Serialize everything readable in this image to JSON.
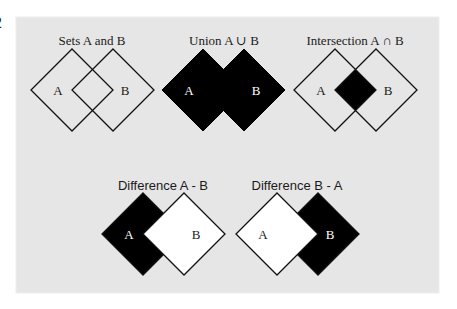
{
  "edge_fragment": {
    "text": "2"
  },
  "colors": {
    "panel": "#e6e6e6",
    "fill": "#000000",
    "outline": "#111111",
    "white": "#ffffff",
    "label_dark": "#1a1a1a",
    "label_light": "#ffffff"
  },
  "panel": {
    "x": 16,
    "y": 17,
    "w": 423,
    "h": 276
  },
  "diagram_size": 41,
  "diagrams": [
    {
      "id": "sets",
      "title": "Sets A and B",
      "title_font": "serif",
      "title_x": 92,
      "title_y": 45,
      "a": {
        "cx": 72,
        "cy": 90,
        "label": "A"
      },
      "b": {
        "cx": 113,
        "cy": 90,
        "label": "B"
      },
      "mode": "outline"
    },
    {
      "id": "union",
      "title": "Union A ∪ B",
      "title_font": "serif",
      "title_x": 224,
      "title_y": 45,
      "a": {
        "cx": 203,
        "cy": 90,
        "label": "A"
      },
      "b": {
        "cx": 244,
        "cy": 90,
        "label": "B"
      },
      "mode": "union"
    },
    {
      "id": "intersection",
      "title": "Intersection A ∩ B",
      "title_font": "serif",
      "title_x": 355,
      "title_y": 45,
      "a": {
        "cx": 335,
        "cy": 90,
        "label": "A"
      },
      "b": {
        "cx": 376,
        "cy": 90,
        "label": "B"
      },
      "mode": "intersection"
    },
    {
      "id": "diff-a-b",
      "title": "Difference A - B",
      "title_font": "sans",
      "title_x": 163,
      "title_y": 190,
      "a": {
        "cx": 143,
        "cy": 234,
        "label": "A"
      },
      "b": {
        "cx": 184,
        "cy": 234,
        "label": "B"
      },
      "mode": "a_minus_b"
    },
    {
      "id": "diff-b-a",
      "title": "Difference B - A",
      "title_font": "sans",
      "title_x": 297,
      "title_y": 190,
      "a": {
        "cx": 277,
        "cy": 234,
        "label": "A"
      },
      "b": {
        "cx": 318,
        "cy": 234,
        "label": "B"
      },
      "mode": "b_minus_a"
    }
  ]
}
